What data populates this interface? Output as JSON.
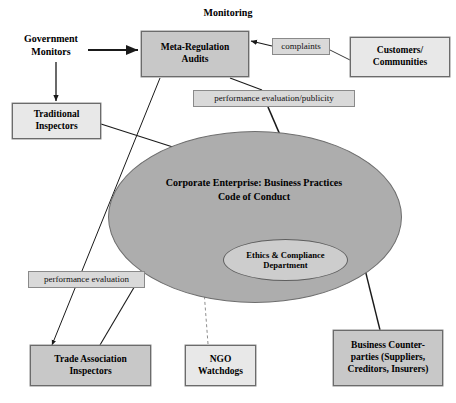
{
  "diagram": {
    "title": "Monitoring",
    "nodes": {
      "monitoring_title": "Monitoring",
      "government_monitors": "Government\nMonitors",
      "meta_regulation_audits": "Meta-Regulation\nAudits",
      "complaints": "complaints",
      "customers_communities": "Customers/\nCommunities",
      "traditional_inspectors": "Traditional\nInspectors",
      "performance_evaluation_publicity": "performance evaluation/publicity",
      "corporate_enterprise": "Corporate Enterprise: Business Practices\nCode of Conduct",
      "ethics_compliance_department": "Ethics & Compliance\nDepartment",
      "performance_evaluation": "performance evaluation",
      "trade_association_inspectors": "Trade Association\nInspectors",
      "ngo_watchdogs": "NGO\nWatchdogs",
      "business_counterparties": "Business Counter-\nparties (Suppliers,\nCreditors, Insurers)"
    },
    "colors": {
      "box_fill": "#c8c8c8",
      "box_border": "#6b6b6b",
      "label_fill": "#d9d9d9",
      "ellipse_fill": "#adadad",
      "inner_ellipse_fill": "#cdcdcd",
      "edge_stroke": "#1a1a1a",
      "page_background": "#ffffff"
    },
    "edges": [
      {
        "from": "government_monitors",
        "to": "meta_regulation_audits",
        "style": "solid",
        "arrow": "end"
      },
      {
        "from": "government_monitors",
        "to": "traditional_inspectors",
        "style": "solid",
        "arrow": "end"
      },
      {
        "from": "customers_communities",
        "to": "complaints",
        "style": "solid",
        "arrow": "none"
      },
      {
        "from": "complaints",
        "to": "meta_regulation_audits",
        "style": "solid",
        "arrow": "end"
      },
      {
        "from": "meta_regulation_audits",
        "to": "corporate_enterprise",
        "style": "solid",
        "arrow": "end"
      },
      {
        "from": "meta_regulation_audits",
        "to": "trade_association_inspectors",
        "style": "solid",
        "arrow": "end"
      },
      {
        "from": "traditional_inspectors",
        "to": "corporate_enterprise",
        "style": "solid",
        "arrow": "end"
      },
      {
        "from": "trade_association_inspectors",
        "to": "corporate_enterprise",
        "style": "solid",
        "arrow": "end"
      },
      {
        "from": "ngo_watchdogs",
        "to": "corporate_enterprise",
        "style": "dashed",
        "arrow": "end"
      },
      {
        "from": "business_counterparties",
        "to": "corporate_enterprise",
        "style": "solid",
        "arrow": "end"
      },
      {
        "from": "ethics_compliance_department",
        "to": "corporate_enterprise",
        "style": "solid",
        "arrow": "end"
      }
    ]
  }
}
